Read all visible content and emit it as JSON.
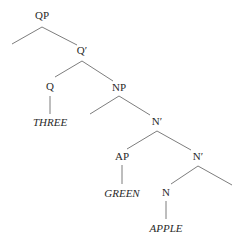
{
  "diagram": {
    "type": "syntax-tree",
    "line_color": "#6e6e6e",
    "text_color": "#2a2a2a",
    "nodes": [
      {
        "id": "qp",
        "label": "QP",
        "x": 42,
        "y": 19,
        "kind": "phrase"
      },
      {
        "id": "qbar",
        "label": "Q′",
        "x": 82,
        "y": 54,
        "kind": "bar"
      },
      {
        "id": "q",
        "label": "Q",
        "x": 50,
        "y": 90,
        "kind": "head"
      },
      {
        "id": "three",
        "label": "THREE",
        "x": 50,
        "y": 126,
        "kind": "leaf"
      },
      {
        "id": "np",
        "label": "NP",
        "x": 119,
        "y": 91,
        "kind": "phrase"
      },
      {
        "id": "nbar1",
        "label": "N′",
        "x": 157,
        "y": 125,
        "kind": "bar"
      },
      {
        "id": "ap",
        "label": "AP",
        "x": 122,
        "y": 160,
        "kind": "phrase"
      },
      {
        "id": "green",
        "label": "GREEN",
        "x": 122,
        "y": 197,
        "kind": "leaf"
      },
      {
        "id": "nbar2",
        "label": "N′",
        "x": 198,
        "y": 160,
        "kind": "bar"
      },
      {
        "id": "n",
        "label": "N",
        "x": 166,
        "y": 196,
        "kind": "head"
      },
      {
        "id": "apple",
        "label": "APPLE",
        "x": 166,
        "y": 232,
        "kind": "leaf"
      }
    ],
    "edges": [
      {
        "from": "qp",
        "to": "spec-qp",
        "x1": 42,
        "y1": 27,
        "x2": 12,
        "y2": 44
      },
      {
        "from": "qp",
        "to": "qbar",
        "x1": 42,
        "y1": 27,
        "x2": 77,
        "y2": 45
      },
      {
        "from": "qbar",
        "to": "q",
        "x1": 82,
        "y1": 61,
        "x2": 55,
        "y2": 77
      },
      {
        "from": "qbar",
        "to": "np",
        "x1": 82,
        "y1": 61,
        "x2": 113,
        "y2": 81
      },
      {
        "from": "q",
        "to": "three",
        "x1": 50,
        "y1": 96,
        "x2": 50,
        "y2": 114
      },
      {
        "from": "np",
        "to": "spec-np",
        "x1": 119,
        "y1": 96,
        "x2": 90,
        "y2": 114
      },
      {
        "from": "np",
        "to": "nbar1",
        "x1": 119,
        "y1": 96,
        "x2": 150,
        "y2": 115
      },
      {
        "from": "nbar1",
        "to": "ap",
        "x1": 157,
        "y1": 131,
        "x2": 127,
        "y2": 149
      },
      {
        "from": "nbar1",
        "to": "nbar2",
        "x1": 157,
        "y1": 131,
        "x2": 191,
        "y2": 150
      },
      {
        "from": "ap",
        "to": "green",
        "x1": 122,
        "y1": 165,
        "x2": 122,
        "y2": 184
      },
      {
        "from": "nbar2",
        "to": "n",
        "x1": 198,
        "y1": 166,
        "x2": 171,
        "y2": 184
      },
      {
        "from": "nbar2",
        "to": "complement",
        "x1": 198,
        "y1": 166,
        "x2": 232,
        "y2": 185
      },
      {
        "from": "n",
        "to": "apple",
        "x1": 166,
        "y1": 201,
        "x2": 166,
        "y2": 219
      }
    ]
  }
}
